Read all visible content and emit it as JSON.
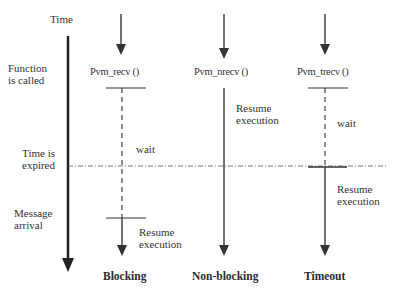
{
  "axis": {
    "time_label": "Time"
  },
  "events": {
    "function_called": [
      "Function",
      "is called"
    ],
    "time_expired": [
      "Time is",
      "expired"
    ],
    "message_arrival": [
      "Message",
      "arrival"
    ]
  },
  "columns": [
    {
      "caption": "Blocking",
      "function": "Pvm_recv ()",
      "wait_label": "wait",
      "resume_label": [
        "Resume",
        "execution"
      ]
    },
    {
      "caption": "Non-blocking",
      "function": "Pvm_nrecv ()",
      "resume_label": [
        "Resume",
        "execution"
      ]
    },
    {
      "caption": "Timeout",
      "function": "Pvm_trecv ()",
      "wait_label": "wait",
      "resume_label": [
        "Resume",
        "execution"
      ]
    }
  ]
}
